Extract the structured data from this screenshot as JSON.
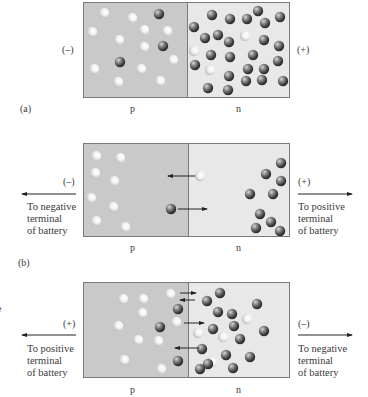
{
  "figure": {
    "panels": [
      {
        "id": "a",
        "caption": "(a)",
        "left_polarity": "(–)",
        "right_polarity": "(+)",
        "p_label": "p",
        "n_label": "n",
        "box": {
          "x": 83,
          "y": 2,
          "w": 207,
          "h": 96,
          "divider_x": 187
        },
        "left_terminal_text": "",
        "right_terminal_text": "",
        "holes": [
          [
            104,
            13
          ],
          [
            132,
            18
          ],
          [
            144,
            30
          ],
          [
            167,
            31
          ],
          [
            92,
            32
          ],
          [
            119,
            40
          ],
          [
            144,
            47
          ],
          [
            173,
            60
          ],
          [
            94,
            69
          ],
          [
            141,
            69
          ],
          [
            118,
            82
          ],
          [
            160,
            81
          ],
          [
            245,
            36
          ],
          [
            194,
            51
          ],
          [
            210,
            70
          ]
        ],
        "electrons": [
          [
            159,
            14
          ],
          [
            163,
            46
          ],
          [
            120,
            62
          ],
          [
            212,
            15
          ],
          [
            230,
            19
          ],
          [
            247,
            19
          ],
          [
            258,
            11
          ],
          [
            265,
            23
          ],
          [
            280,
            17
          ],
          [
            194,
            27
          ],
          [
            205,
            38
          ],
          [
            218,
            35
          ],
          [
            229,
            42
          ],
          [
            264,
            40
          ],
          [
            279,
            46
          ],
          [
            211,
            55
          ],
          [
            230,
            57
          ],
          [
            253,
            55
          ],
          [
            278,
            61
          ],
          [
            195,
            65
          ],
          [
            248,
            69
          ],
          [
            264,
            69
          ],
          [
            229,
            76
          ],
          [
            246,
            81
          ],
          [
            208,
            88
          ],
          [
            228,
            90
          ],
          [
            262,
            80
          ],
          [
            283,
            81
          ]
        ],
        "arrows": []
      },
      {
        "id": "b",
        "caption": "(b)",
        "left_polarity": "(–)",
        "right_polarity": "(+)",
        "p_label": "p",
        "n_label": "n",
        "box": {
          "x": 83,
          "y": 143,
          "w": 207,
          "h": 94,
          "divider_x": 188
        },
        "left_terminal_text": "To negative\nterminal\nof battery",
        "right_terminal_text": "To positive\nterminal\nof battery",
        "holes": [
          [
            96,
            156
          ],
          [
            120,
            158
          ],
          [
            95,
            173
          ],
          [
            114,
            181
          ],
          [
            91,
            198
          ],
          [
            113,
            207
          ],
          [
            96,
            221
          ],
          [
            125,
            227
          ],
          [
            200,
            176
          ]
        ],
        "electrons": [
          [
            171,
            209
          ],
          [
            281,
            163
          ],
          [
            266,
            174
          ],
          [
            281,
            181
          ],
          [
            250,
            194
          ],
          [
            273,
            194
          ],
          [
            260,
            214
          ],
          [
            271,
            222
          ],
          [
            256,
            228
          ],
          [
            280,
            231
          ]
        ],
        "arrows": [
          [
            195,
            176,
            168,
            176
          ],
          [
            178,
            209,
            207,
            209
          ]
        ]
      },
      {
        "id": "c",
        "caption": "",
        "left_polarity": "(+)",
        "right_polarity": "(–)",
        "p_label": "p",
        "n_label": "n",
        "box": {
          "x": 83,
          "y": 282,
          "w": 207,
          "h": 96,
          "divider_x": 188
        },
        "left_terminal_text": "To positive\nterminal\nof battery",
        "right_terminal_text": "To negative\nterminal\nof battery",
        "holes": [
          [
            123,
            299
          ],
          [
            143,
            299
          ],
          [
            170,
            294
          ],
          [
            142,
            313
          ],
          [
            118,
            326
          ],
          [
            138,
            340
          ],
          [
            158,
            341
          ],
          [
            124,
            360
          ],
          [
            161,
            369
          ],
          [
            176,
            322
          ],
          [
            247,
            319
          ],
          [
            198,
            333
          ],
          [
            223,
            337
          ],
          [
            212,
            362
          ]
        ],
        "electrons": [
          [
            178,
            309
          ],
          [
            160,
            327
          ],
          [
            178,
            361
          ],
          [
            207,
            301
          ],
          [
            220,
            293
          ],
          [
            257,
            304
          ],
          [
            218,
            312
          ],
          [
            232,
            314
          ],
          [
            213,
            329
          ],
          [
            234,
            326
          ],
          [
            240,
            339
          ],
          [
            264,
            331
          ],
          [
            202,
            349
          ],
          [
            226,
            355
          ],
          [
            250,
            357
          ],
          [
            208,
            364
          ],
          [
            233,
            368
          ],
          [
            200,
            369
          ]
        ],
        "arrows": [
          [
            180,
            293,
            196,
            293
          ],
          [
            195,
            300,
            180,
            300
          ],
          [
            184,
            323,
            204,
            323
          ],
          [
            199,
            348,
            175,
            348
          ]
        ]
      }
    ],
    "edge_glyph": "e",
    "colors": {
      "p_region": "#c9c9c9",
      "n_region": "#e8e8e8",
      "border": "#7a7a7a",
      "electron_dark": "#3a3a3a",
      "electron_light": "#9a9a9a",
      "hole_light": "#fafafa",
      "hole_shade": "#bdbdbd",
      "arrow": "#222222",
      "text": "#3a3a3a"
    }
  }
}
